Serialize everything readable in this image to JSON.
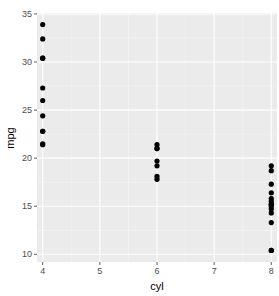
{
  "chart_data": {
    "type": "scatter",
    "title": "",
    "xlabel": "cyl",
    "ylabel": "mpg",
    "xlim": [
      3.9,
      8.1
    ],
    "ylim": [
      9.2,
      35.1
    ],
    "x_ticks": [
      4,
      5,
      6,
      7,
      8
    ],
    "y_ticks": [
      10,
      15,
      20,
      25,
      30,
      35
    ],
    "grid": true,
    "legend": "none",
    "colors": {
      "panel": "#ebebeb",
      "grid": "#ffffff",
      "point": "#000000",
      "tick_text": "#4d4d4d"
    },
    "points": [
      {
        "x": 4,
        "y": 22.8
      },
      {
        "x": 4,
        "y": 24.4
      },
      {
        "x": 4,
        "y": 22.8
      },
      {
        "x": 4,
        "y": 32.4
      },
      {
        "x": 4,
        "y": 30.4
      },
      {
        "x": 4,
        "y": 33.9
      },
      {
        "x": 4,
        "y": 21.5
      },
      {
        "x": 4,
        "y": 27.3
      },
      {
        "x": 4,
        "y": 26.0
      },
      {
        "x": 4,
        "y": 30.4
      },
      {
        "x": 4,
        "y": 21.4
      },
      {
        "x": 6,
        "y": 21.0
      },
      {
        "x": 6,
        "y": 21.0
      },
      {
        "x": 6,
        "y": 21.4
      },
      {
        "x": 6,
        "y": 18.1
      },
      {
        "x": 6,
        "y": 19.2
      },
      {
        "x": 6,
        "y": 17.8
      },
      {
        "x": 6,
        "y": 19.7
      },
      {
        "x": 8,
        "y": 18.7
      },
      {
        "x": 8,
        "y": 14.3
      },
      {
        "x": 8,
        "y": 16.4
      },
      {
        "x": 8,
        "y": 17.3
      },
      {
        "x": 8,
        "y": 15.2
      },
      {
        "x": 8,
        "y": 10.4
      },
      {
        "x": 8,
        "y": 10.4
      },
      {
        "x": 8,
        "y": 14.7
      },
      {
        "x": 8,
        "y": 15.5
      },
      {
        "x": 8,
        "y": 15.2
      },
      {
        "x": 8,
        "y": 13.3
      },
      {
        "x": 8,
        "y": 19.2
      },
      {
        "x": 8,
        "y": 15.8
      },
      {
        "x": 8,
        "y": 15.0
      }
    ]
  }
}
